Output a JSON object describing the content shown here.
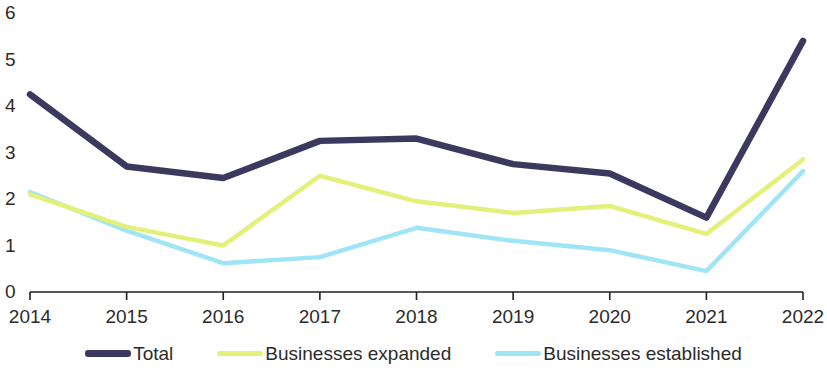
{
  "chart_data": {
    "type": "line",
    "title": "",
    "subtitle": "",
    "xlabel": "",
    "ylabel": "",
    "categories": [
      "2014",
      "2015",
      "2016",
      "2017",
      "2018",
      "2019",
      "2020",
      "2021",
      "2022"
    ],
    "x": [
      2014,
      2015,
      2016,
      2017,
      2018,
      2019,
      2020,
      2021,
      2022
    ],
    "ylim": [
      0,
      6
    ],
    "yticks": [
      0,
      1,
      2,
      3,
      4,
      5,
      6
    ],
    "ytick_labels": [
      "0",
      "1",
      "2",
      "3",
      "4",
      "5",
      "6"
    ],
    "grid": false,
    "legend_position": "bottom",
    "series": [
      {
        "name": "Total",
        "color": "#3b3a5e",
        "values": [
          4.25,
          2.7,
          2.45,
          3.25,
          3.3,
          2.75,
          2.55,
          1.6,
          5.4
        ]
      },
      {
        "name": "Businesses expanded",
        "color": "#e3f07a",
        "values": [
          2.1,
          1.4,
          1.0,
          2.5,
          1.95,
          1.7,
          1.85,
          1.25,
          2.85
        ]
      },
      {
        "name": "Businesses established",
        "color": "#9fe5f5",
        "values": [
          2.15,
          1.32,
          0.62,
          0.75,
          1.38,
          1.1,
          0.9,
          0.45,
          2.6
        ]
      }
    ]
  },
  "axis": {
    "line_color": "#231f20"
  },
  "legend": {
    "items": [
      {
        "label": "Total",
        "color": "#3b3a5e",
        "weight": "thick"
      },
      {
        "label": "Businesses expanded",
        "color": "#e3f07a",
        "weight": "thin"
      },
      {
        "label": "Businesses established",
        "color": "#9fe5f5",
        "weight": "thin"
      }
    ]
  }
}
